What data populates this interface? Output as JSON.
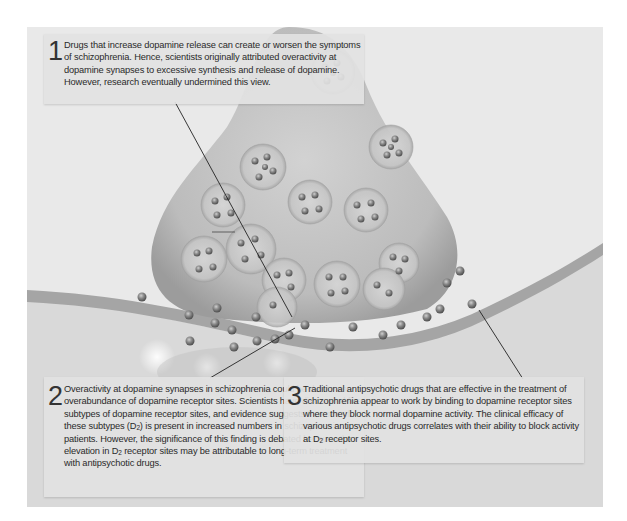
{
  "figure": {
    "colors": {
      "background": "#e9e9e9",
      "terminal": "#bdbdbd",
      "membrane": "#a9a9a9",
      "callout_bg": "#e2e2e2",
      "text": "#2a2a2a"
    }
  },
  "callouts": [
    {
      "number": "1",
      "text": "Drugs that increase dopamine release can create or worsen the symptoms of schizophrenia. Hence, scientists originally attributed overactivity at dopamine synapses to excessive synthesis and release of dopamine. However, research eventually undermined this view."
    },
    {
      "number": "2",
      "text_parts": [
        "Overactivity at dopamine synapses in schizophrenia could be due to an overabundance of dopamine receptor sites. Scientists have discovered five subtypes of dopamine receptor sites, and evidence suggests that one of these subtypes (D",
        "2",
        ") is present in increased numbers in schizophrenic patients. However, the significance of this finding is debated because the elevation in D",
        "2",
        " receptor sites may be attributable to long-term treatment with antipsychotic drugs."
      ]
    },
    {
      "number": "3",
      "text_parts": [
        "Traditional antipsychotic drugs that are effective in the treatment of schizophrenia appear to work by binding to dopamine receptor sites where they block normal dopamine activity. The clinical efficacy of various antipsychotic drugs correlates with their ability to block activity at D",
        "2",
        " receptor sites."
      ]
    }
  ]
}
